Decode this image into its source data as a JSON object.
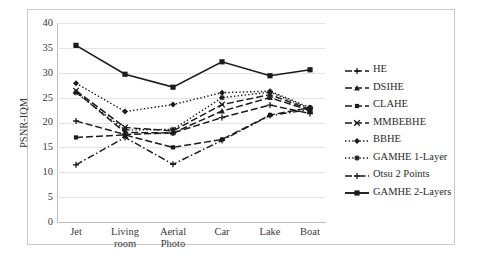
{
  "chart_data": {
    "type": "line",
    "title": "",
    "xlabel": "",
    "ylabel": "PSNR-IQM",
    "ylim": [
      0,
      40
    ],
    "ytick_step": 5,
    "yticks": [
      40,
      35,
      30,
      25,
      20,
      15,
      10,
      5,
      0
    ],
    "grid": true,
    "legend_position": "right",
    "categories": [
      "Jet",
      "Living room",
      "Aerial Photo",
      "Car",
      "Lake",
      "Boat"
    ],
    "series": [
      {
        "name": "HE",
        "values": [
          20.3,
          17.6,
          17.9,
          21.0,
          23.5,
          21.8
        ]
      },
      {
        "name": "DSIHE",
        "values": [
          26.2,
          18.0,
          17.9,
          22.3,
          25.0,
          22.4
        ]
      },
      {
        "name": "CLAHE",
        "values": [
          17.0,
          17.5,
          15.0,
          16.6,
          21.5,
          23.0
        ]
      },
      {
        "name": "MMBEBHE",
        "values": [
          26.4,
          19.0,
          18.3,
          23.6,
          25.6,
          22.6
        ]
      },
      {
        "name": "BBHE",
        "values": [
          27.9,
          22.2,
          23.6,
          26.0,
          26.3,
          23.0
        ]
      },
      {
        "name": "GAMHE 1-Layer",
        "values": [
          26.0,
          18.5,
          18.6,
          25.0,
          26.1,
          22.8
        ]
      },
      {
        "name": "Otsu 2 Points",
        "values": [
          11.5,
          17.0,
          11.6,
          16.4,
          21.4,
          22.6
        ]
      },
      {
        "name": "GAMHE 2-Layers",
        "values": [
          35.5,
          29.7,
          27.1,
          32.2,
          29.4,
          30.6
        ]
      }
    ]
  },
  "legend": {
    "items": [
      {
        "label": "HE",
        "style": "dashed-long",
        "marker": "plus"
      },
      {
        "label": "DSIHE",
        "style": "dashed-long",
        "marker": "triangle"
      },
      {
        "label": "CLAHE",
        "style": "dashed-long",
        "marker": "square-small"
      },
      {
        "label": "MMBEBHE",
        "style": "dashed-long",
        "marker": "cross"
      },
      {
        "label": "BBHE",
        "style": "dotted",
        "marker": "diamond"
      },
      {
        "label": "GAMHE 1-Layer",
        "style": "dotted",
        "marker": "star"
      },
      {
        "label": "Otsu 2 Points",
        "style": "dashdot",
        "marker": "plus"
      },
      {
        "label": "GAMHE 2-Layers",
        "style": "solid",
        "marker": "square"
      }
    ]
  },
  "axis": {
    "y_title": "PSNR-IQM"
  },
  "caption": {
    "text": ""
  }
}
